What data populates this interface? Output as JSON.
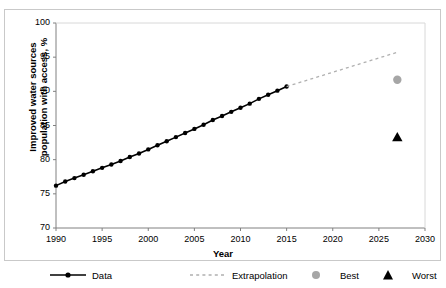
{
  "chart_data": {
    "type": "line",
    "title": "",
    "xlabel": "Year",
    "ylabel": "Improved water sources\npopulation with access, %",
    "xlim": [
      1990,
      2030
    ],
    "ylim": [
      70,
      100
    ],
    "xticks": [
      1990,
      1995,
      2000,
      2005,
      2010,
      2015,
      2020,
      2025,
      2030
    ],
    "yticks": [
      70,
      75,
      80,
      85,
      90,
      95,
      100
    ],
    "grid": false,
    "legend_position": "bottom",
    "series": [
      {
        "name": "Data",
        "type": "line",
        "marker": "circle",
        "color": "#000000",
        "linestyle": "solid",
        "x": [
          1990,
          1991,
          1992,
          1993,
          1994,
          1995,
          1996,
          1997,
          1998,
          1999,
          2000,
          2001,
          2002,
          2003,
          2004,
          2005,
          2006,
          2007,
          2008,
          2009,
          2010,
          2011,
          2012,
          2013,
          2014,
          2015
        ],
        "values": [
          76.2,
          76.8,
          77.3,
          77.8,
          78.3,
          78.8,
          79.3,
          79.8,
          80.4,
          80.9,
          81.5,
          82.1,
          82.7,
          83.3,
          83.9,
          84.5,
          85.1,
          85.8,
          86.4,
          87.0,
          87.6,
          88.2,
          88.9,
          89.5,
          90.1,
          90.7
        ]
      },
      {
        "name": "Extrapolation",
        "type": "line",
        "marker": "none",
        "color": "#b0b0b0",
        "linestyle": "dashed",
        "x": [
          2015,
          2027.2
        ],
        "values": [
          90.7,
          95.8
        ]
      },
      {
        "name": "Best",
        "type": "scatter",
        "marker": "circle",
        "color": "#a6a6a6",
        "x": [
          2027
        ],
        "values": [
          91.7
        ]
      },
      {
        "name": "Worst",
        "type": "scatter",
        "marker": "triangle",
        "color": "#000000",
        "x": [
          2027
        ],
        "values": [
          83.3
        ]
      }
    ]
  },
  "legend": {
    "items": [
      {
        "label": "Data",
        "key": "solid-line-with-circle-marker"
      },
      {
        "label": "Extrapolation",
        "key": "dashed-gray-line"
      },
      {
        "label": "Best",
        "key": "gray-circle-marker"
      },
      {
        "label": "Worst",
        "key": "black-triangle-marker"
      }
    ]
  }
}
